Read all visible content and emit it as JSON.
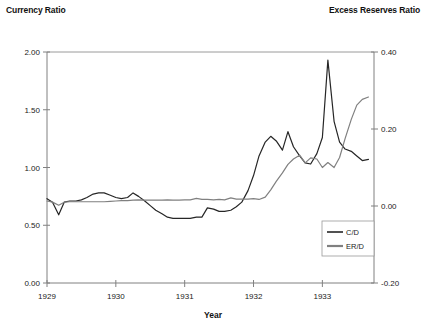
{
  "labels": {
    "left_axis_title": "Currency Ratio",
    "right_axis_title": "Excess Reserves Ratio",
    "x_axis_title": "Year"
  },
  "colors": {
    "series_cd": "#262626",
    "series_erd": "#808080",
    "axis": "#808080",
    "text": "#222222"
  },
  "chart_data": {
    "type": "line",
    "title": "",
    "xlabel": "Year",
    "ylabel": "Currency Ratio",
    "y2label": "Excess Reserves Ratio",
    "grid": false,
    "legend_position": "inside-lower-right",
    "xlim": [
      1929.0,
      1933.75
    ],
    "ylim": [
      0.0,
      2.0
    ],
    "y2lim": [
      -0.2,
      0.4
    ],
    "xticks": [
      "1929",
      "1930",
      "1931",
      "1932",
      "1933"
    ],
    "xtick_values": [
      1929,
      1930,
      1931,
      1932,
      1933
    ],
    "yticks": [
      "0.00",
      "0.50",
      "1.00",
      "1.50",
      "2.00"
    ],
    "ytick_values": [
      0.0,
      0.5,
      1.0,
      1.5,
      2.0
    ],
    "y2ticks": [
      "-0.20",
      "0.00",
      "0.20",
      "0.40"
    ],
    "y2tick_values": [
      -0.2,
      0.0,
      0.2,
      0.4
    ],
    "series": [
      {
        "name": "C/D",
        "axis": "left",
        "color": "#262626",
        "x": [
          1929.0,
          1929.08,
          1929.17,
          1929.25,
          1929.33,
          1929.42,
          1929.5,
          1929.58,
          1929.67,
          1929.75,
          1929.83,
          1929.92,
          1930.0,
          1930.08,
          1930.17,
          1930.25,
          1930.33,
          1930.42,
          1930.5,
          1930.58,
          1930.67,
          1930.75,
          1930.83,
          1930.92,
          1931.0,
          1931.08,
          1931.17,
          1931.25,
          1931.33,
          1931.42,
          1931.5,
          1931.58,
          1931.67,
          1931.75,
          1931.83,
          1931.92,
          1932.0,
          1932.08,
          1932.17,
          1932.25,
          1932.33,
          1932.42,
          1932.5,
          1932.58,
          1932.67,
          1932.75,
          1932.83,
          1932.92,
          1933.0,
          1933.08,
          1933.17,
          1933.25,
          1933.33,
          1933.42,
          1933.5,
          1933.58,
          1933.67
        ],
        "values": [
          0.73,
          0.7,
          0.59,
          0.7,
          0.71,
          0.71,
          0.72,
          0.74,
          0.77,
          0.78,
          0.78,
          0.76,
          0.74,
          0.73,
          0.74,
          0.78,
          0.75,
          0.71,
          0.67,
          0.63,
          0.6,
          0.57,
          0.56,
          0.56,
          0.56,
          0.56,
          0.57,
          0.57,
          0.65,
          0.64,
          0.62,
          0.62,
          0.63,
          0.66,
          0.7,
          0.8,
          0.93,
          1.1,
          1.22,
          1.27,
          1.23,
          1.15,
          1.31,
          1.18,
          1.1,
          1.04,
          1.03,
          1.12,
          1.26,
          1.93,
          1.4,
          1.22,
          1.16,
          1.14,
          1.1,
          1.06,
          1.07
        ]
      },
      {
        "name": "ER/D",
        "axis": "right",
        "color": "#808080",
        "x": [
          1929.0,
          1929.08,
          1929.17,
          1929.25,
          1929.33,
          1929.42,
          1929.5,
          1929.58,
          1929.67,
          1929.75,
          1929.83,
          1929.92,
          1930.0,
          1930.08,
          1930.17,
          1930.25,
          1930.33,
          1930.42,
          1930.5,
          1930.58,
          1930.67,
          1930.75,
          1930.83,
          1930.92,
          1931.0,
          1931.08,
          1931.17,
          1931.25,
          1931.33,
          1931.42,
          1931.5,
          1931.58,
          1931.67,
          1931.75,
          1931.83,
          1931.92,
          1932.0,
          1932.08,
          1932.17,
          1932.25,
          1932.33,
          1932.42,
          1932.5,
          1932.58,
          1932.67,
          1932.75,
          1932.83,
          1932.92,
          1933.0,
          1933.08,
          1933.17,
          1933.25,
          1933.33,
          1933.42,
          1933.5,
          1933.58,
          1933.67
        ],
        "values": [
          0.013,
          0.01,
          0.002,
          0.01,
          0.011,
          0.011,
          0.011,
          0.011,
          0.011,
          0.011,
          0.011,
          0.012,
          0.013,
          0.014,
          0.014,
          0.015,
          0.016,
          0.015,
          0.015,
          0.015,
          0.015,
          0.016,
          0.015,
          0.015,
          0.016,
          0.016,
          0.02,
          0.017,
          0.017,
          0.016,
          0.017,
          0.016,
          0.021,
          0.018,
          0.018,
          0.018,
          0.019,
          0.017,
          0.023,
          0.042,
          0.064,
          0.086,
          0.108,
          0.122,
          0.132,
          0.112,
          0.125,
          0.122,
          0.1,
          0.113,
          0.1,
          0.126,
          0.175,
          0.225,
          0.262,
          0.277,
          0.283
        ]
      }
    ]
  }
}
